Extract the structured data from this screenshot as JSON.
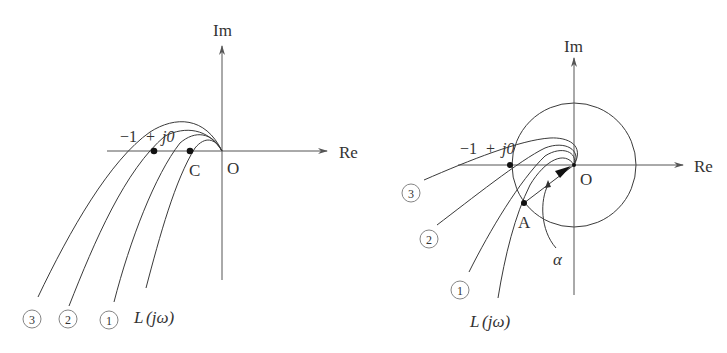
{
  "figures": [
    {
      "id": "left",
      "axes": {
        "x_label": "Re",
        "y_label": "Im",
        "origin_label": "O"
      },
      "points": [
        {
          "label": "−1 + j0",
          "desc": "critical point"
        },
        {
          "label": "C",
          "desc": "crossing point of L(jω) on negative real axis"
        }
      ],
      "curves": [
        {
          "label": "③"
        },
        {
          "label": "②"
        },
        {
          "label": "①"
        },
        {
          "label": "L(jω)"
        }
      ]
    },
    {
      "id": "right",
      "axes": {
        "x_label": "Re",
        "y_label": "Im",
        "origin_label": "O"
      },
      "unit_circle": true,
      "points": [
        {
          "label": "−1 + j0",
          "desc": "critical point"
        },
        {
          "label": "A",
          "desc": "intersection of L(jω) with unit circle"
        }
      ],
      "angle_label": "α",
      "curves": [
        {
          "label": "③"
        },
        {
          "label": "②"
        },
        {
          "label": "①"
        },
        {
          "label": "L(jω)"
        }
      ]
    }
  ],
  "labels": {
    "left_im": "Im",
    "left_re": "Re",
    "left_o": "O",
    "left_critical_minus": "−1",
    "left_critical_plus": "+",
    "left_critical_j0": "j0",
    "left_c": "C",
    "left_curve3": "3",
    "left_curve2": "2",
    "left_curve1": "1",
    "left_L": "L",
    "left_jw": "(jω)",
    "right_im": "Im",
    "right_re": "Re",
    "right_o": "O",
    "right_critical_minus": "−1",
    "right_critical_plus": "+",
    "right_critical_j0": "j0",
    "right_a": "A",
    "right_alpha": "α",
    "right_curve3": "3",
    "right_curve2": "2",
    "right_curve1": "1",
    "right_L": "L",
    "right_jw": "(jω)"
  }
}
